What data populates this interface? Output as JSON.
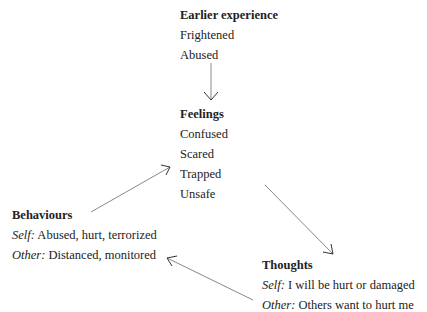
{
  "nodes": {
    "earlier": {
      "title": "Earlier experience",
      "items": [
        "Frightened",
        "Abused"
      ]
    },
    "feelings": {
      "title": "Feelings",
      "items": [
        "Confused",
        "Scared",
        "Trapped",
        "Unsafe"
      ]
    },
    "behaviours": {
      "title": "Behaviours",
      "lines": [
        {
          "label": "Self:",
          "text": " Abused, hurt, terrorized"
        },
        {
          "label": "Other:",
          "text": " Distanced, monitored"
        }
      ]
    },
    "thoughts": {
      "title": "Thoughts",
      "lines": [
        {
          "label": "Self:",
          "text": " I will be hurt or damaged"
        },
        {
          "label": "Other:",
          "text": " Others want to hurt me"
        }
      ]
    }
  },
  "arrows": [
    {
      "from": "earlier",
      "to": "feelings"
    },
    {
      "from": "feelings",
      "to": "thoughts"
    },
    {
      "from": "thoughts",
      "to": "behaviours"
    },
    {
      "from": "behaviours",
      "to": "feelings"
    }
  ],
  "colors": {
    "text": "#222222",
    "arrow": "#888888",
    "arrowhead": "#333333"
  }
}
